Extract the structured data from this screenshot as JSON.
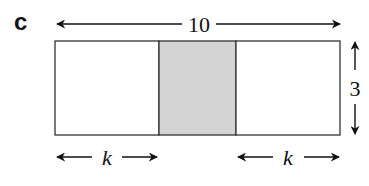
{
  "figure": {
    "part_label": "c",
    "labels": {
      "width": "10",
      "height": "3",
      "left_segment": "k",
      "right_segment": "k"
    },
    "colors": {
      "outline": "#333333",
      "shaded_fill": "#d4d4d4",
      "arrow": "#111111"
    }
  }
}
